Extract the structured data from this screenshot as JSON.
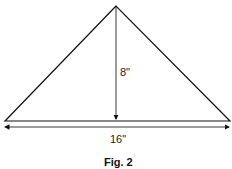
{
  "figure": {
    "caption": "Fig. 2",
    "shape": "isosceles-triangle",
    "height_label": "8\"",
    "base_label": "16\"",
    "colors": {
      "stroke": "#111111",
      "background": "#ffffff"
    }
  }
}
